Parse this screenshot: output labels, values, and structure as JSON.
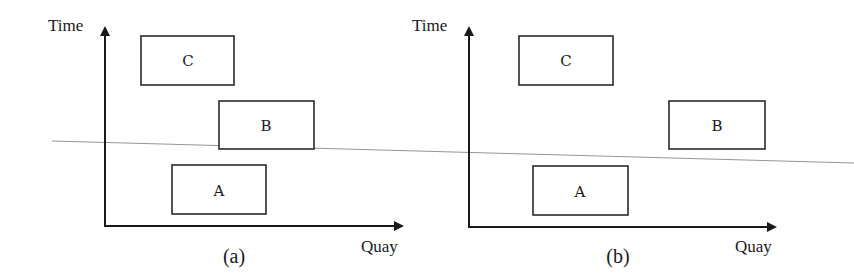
{
  "panels": [
    {
      "id": "a",
      "caption": "(a)",
      "y_axis_label": "Time",
      "x_axis_label": "Quay",
      "boxes": [
        {
          "label": "C"
        },
        {
          "label": "B"
        },
        {
          "label": "A"
        }
      ]
    },
    {
      "id": "b",
      "caption": "(b)",
      "y_axis_label": "Time",
      "x_axis_label": "Quay",
      "boxes": [
        {
          "label": "C"
        },
        {
          "label": "B"
        },
        {
          "label": "A"
        }
      ]
    }
  ],
  "colors": {
    "ink": "#1a1a1a",
    "cut_line": "#8a8a8a",
    "background": "#ffffff"
  }
}
